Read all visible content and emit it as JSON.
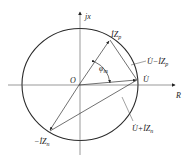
{
  "diagram": {
    "type": "phasor-circle",
    "axes": {
      "real_label": "R",
      "imag_label": "jx",
      "origin_label": "O"
    },
    "vectors": [
      {
        "id": "IZp",
        "label": "İZ",
        "sub": "p",
        "from": "O",
        "to": "circle-upper-right"
      },
      {
        "id": "U",
        "label": "U̇",
        "from": "O",
        "to": "circle-right"
      },
      {
        "id": "-IZn",
        "label": "−İZ",
        "sub": "n",
        "from": "O",
        "to": "circle-lower-left"
      },
      {
        "id": "U-IZp",
        "label": "U̇−İZ",
        "sub": "p",
        "from": "İZp tip",
        "to": "U̇ tip"
      },
      {
        "id": "U+IZn",
        "label": "U̇+İZ",
        "sub": "n",
        "from": "−İZn tip",
        "to": "U̇ tip"
      }
    ],
    "angle": {
      "label": "φ",
      "sub": "m",
      "between": [
        "İZp",
        "U̇"
      ]
    },
    "colors": {
      "stroke": "#333333",
      "circle": "#2a2a2a"
    }
  }
}
